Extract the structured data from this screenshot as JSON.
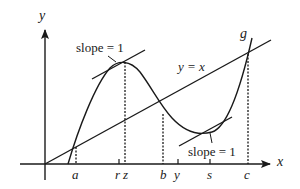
{
  "diagram": {
    "axes": {
      "x_label": "x",
      "y_label": "y"
    },
    "line_label": "y = x",
    "curve_label": "g",
    "annotations": [
      {
        "id": "tangent-max",
        "text": "slope = 1"
      },
      {
        "id": "tangent-min",
        "text": "slope = 1"
      }
    ],
    "x_ticks": [
      {
        "id": "a",
        "label": "a",
        "dotted": true
      },
      {
        "id": "r",
        "label": "r",
        "dotted": false
      },
      {
        "id": "z",
        "label": "z",
        "dotted": true
      },
      {
        "id": "b",
        "label": "b",
        "dotted": true
      },
      {
        "id": "y",
        "label": "y",
        "dotted": false
      },
      {
        "id": "s",
        "label": "s",
        "dotted": false
      },
      {
        "id": "c",
        "label": "c",
        "dotted": true
      }
    ],
    "colors": {
      "ink": "#1a1a1a",
      "background": "#ffffff"
    }
  }
}
